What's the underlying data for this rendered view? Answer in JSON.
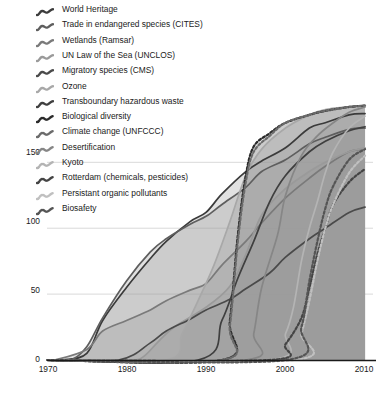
{
  "chart_data": {
    "type": "area",
    "title": "",
    "xlabel": "",
    "ylabel": "",
    "xlim": [
      1970,
      2011
    ],
    "ylim": [
      0,
      195
    ],
    "xticks": [
      "1970",
      "1980",
      "1990",
      "2000",
      "2010"
    ],
    "xtick_values": [
      1970,
      1980,
      1990,
      2000,
      2010
    ],
    "yticks": [
      "0",
      "50",
      "100",
      "150"
    ],
    "ytick_values": [
      0,
      50,
      100,
      150
    ],
    "grid": "horizontal",
    "legend_position": "top-left",
    "stacking": "overlaid-cumulative",
    "series": [
      {
        "name": "World Heritage",
        "label": "World Heritage",
        "color": "#3b3b3b",
        "dash": "solid",
        "x": [
          1970,
          1972,
          1975,
          1977,
          1980,
          1983,
          1985,
          1988,
          1990,
          1992,
          1995,
          1997,
          2000,
          2003,
          2005,
          2008,
          2010
        ],
        "values": [
          0,
          0,
          5,
          30,
          55,
          77,
          90,
          105,
          112,
          126,
          143,
          151,
          161,
          176,
          180,
          186,
          187
        ]
      },
      {
        "name": "Trade in endangered species (CITES)",
        "label": "Trade in endangered species (CITES)",
        "color": "#5e5e5e",
        "dash": "solid",
        "x": [
          1970,
          1973,
          1975,
          1977,
          1980,
          1983,
          1985,
          1988,
          1990,
          1992,
          1995,
          1997,
          2000,
          2003,
          2005,
          2008,
          2010
        ],
        "values": [
          0,
          0,
          10,
          32,
          60,
          82,
          92,
          103,
          109,
          118,
          131,
          143,
          152,
          164,
          169,
          175,
          176
        ]
      },
      {
        "name": "Wetlands (Ramsar)",
        "label": "Wetlands (Ramsar)",
        "color": "#7a7a7a",
        "dash": "solid",
        "x": [
          1970,
          1971,
          1975,
          1977,
          1980,
          1983,
          1985,
          1988,
          1990,
          1992,
          1995,
          1997,
          2000,
          2003,
          2005,
          2008,
          2010
        ],
        "values": [
          0,
          0,
          8,
          22,
          30,
          38,
          45,
          53,
          58,
          72,
          90,
          104,
          123,
          138,
          147,
          158,
          160
        ]
      },
      {
        "name": "UN Law of the Sea (UNCLOS)",
        "label": "UN Law of the Sea (UNCLOS)",
        "color": "#9a9a9a",
        "dash": "solid",
        "x": [
          1970,
          1980,
          1982,
          1984,
          1986,
          1990,
          1993,
          1995,
          1997,
          2000,
          2003,
          2005,
          2008,
          2010
        ],
        "values": [
          0,
          0,
          2,
          14,
          25,
          40,
          56,
          80,
          110,
          130,
          143,
          150,
          158,
          161
        ]
      },
      {
        "name": "Migratory species (CMS)",
        "label": "Migratory species (CMS)",
        "color": "#4a4a4a",
        "dash": "solid",
        "x": [
          1970,
          1979,
          1983,
          1985,
          1988,
          1990,
          1993,
          1995,
          1998,
          2000,
          2003,
          2005,
          2008,
          2010
        ],
        "values": [
          0,
          0,
          13,
          22,
          31,
          38,
          46,
          54,
          66,
          78,
          92,
          100,
          112,
          116
        ]
      },
      {
        "name": "Ozone",
        "label": "Ozone",
        "color": "#a8a8a8",
        "dash": "solid",
        "x": [
          1970,
          1985,
          1987,
          1989,
          1991,
          1993,
          1995,
          1997,
          2000,
          2003,
          2005,
          2008,
          2010
        ],
        "values": [
          0,
          0,
          20,
          45,
          72,
          105,
          140,
          160,
          176,
          186,
          190,
          192,
          193
        ]
      },
      {
        "name": "Transboundary hazardous waste",
        "label": "Transboundary hazardous waste",
        "color": "#3f3f3f",
        "dash": "solid",
        "x": [
          1970,
          1989,
          1992,
          1994,
          1996,
          1998,
          2000,
          2003,
          2005,
          2008,
          2010
        ],
        "values": [
          0,
          0,
          30,
          62,
          90,
          120,
          140,
          158,
          166,
          174,
          177
        ]
      },
      {
        "name": "Biological diversity",
        "label": "Biological diversity",
        "color": "#2b2b2b",
        "dash": "dotted",
        "x": [
          1970,
          1992,
          1993,
          1994,
          1995,
          1996,
          1998,
          2000,
          2003,
          2005,
          2008,
          2010
        ],
        "values": [
          0,
          0,
          30,
          95,
          140,
          162,
          172,
          180,
          186,
          189,
          192,
          193
        ]
      },
      {
        "name": "Climate change (UNFCCC)",
        "label": "Climate change (UNFCCC)",
        "color": "#6b6b6b",
        "dash": "dotted",
        "x": [
          1970,
          1992,
          1993,
          1994,
          1995,
          1996,
          1998,
          2000,
          2003,
          2005,
          2008,
          2010
        ],
        "values": [
          0,
          0,
          26,
          90,
          135,
          158,
          170,
          180,
          186,
          189,
          192,
          193
        ]
      },
      {
        "name": "Desertification",
        "label": "Desertification",
        "color": "#868686",
        "dash": "solid",
        "x": [
          1970,
          1995,
          1996,
          1997,
          1999,
          2000,
          2002,
          2004,
          2006,
          2008,
          2010
        ],
        "values": [
          0,
          0,
          20,
          55,
          95,
          125,
          155,
          170,
          180,
          188,
          192
        ]
      },
      {
        "name": "Kyoto",
        "label": "Kyoto",
        "color": "#b4b4b4",
        "dash": "solid",
        "x": [
          1970,
          1998,
          2000,
          2001,
          2002,
          2003,
          2004,
          2005,
          2006,
          2008,
          2010
        ],
        "values": [
          0,
          0,
          20,
          40,
          75,
          100,
          120,
          142,
          158,
          176,
          185
        ]
      },
      {
        "name": "Rotterdam (chemicals, pesticides)",
        "label": "Rotterdam (chemicals, pesticides)",
        "color": "#444444",
        "dash": "dotted",
        "x": [
          1970,
          1998,
          2000,
          2002,
          2003,
          2004,
          2005,
          2006,
          2008,
          2010
        ],
        "values": [
          0,
          0,
          12,
          32,
          55,
          80,
          100,
          118,
          135,
          145
        ]
      },
      {
        "name": "Persistant organic pollutants",
        "label": "Persistant organic pollutants",
        "color": "#c0c0c0",
        "dash": "dotted",
        "x": [
          1970,
          2001,
          2002,
          2003,
          2004,
          2005,
          2006,
          2008,
          2010
        ],
        "values": [
          0,
          0,
          20,
          45,
          75,
          100,
          118,
          142,
          155
        ]
      },
      {
        "name": "Biosafety",
        "label": "Biosafety",
        "color": "#555555",
        "dash": "dotted",
        "x": [
          1970,
          2000,
          2002,
          2003,
          2004,
          2005,
          2006,
          2008,
          2010
        ],
        "values": [
          0,
          0,
          25,
          60,
          90,
          115,
          132,
          152,
          160
        ]
      }
    ]
  },
  "axes": {
    "y_tick_labels": [
      "150",
      "100",
      "50",
      "0"
    ],
    "x_tick_labels": [
      "1970",
      "1980",
      "1990",
      "2000",
      "2010"
    ]
  },
  "legend": {
    "items": [
      {
        "label": "World Heritage",
        "icon": "squiggle-line-icon",
        "color": "#3b3b3b"
      },
      {
        "label": "Trade in endangered species (CITES)",
        "icon": "squiggle-line-icon",
        "color": "#5e5e5e"
      },
      {
        "label": "Wetlands (Ramsar)",
        "icon": "squiggle-line-icon",
        "color": "#7a7a7a"
      },
      {
        "label": "UN Law of the Sea (UNCLOS)",
        "icon": "squiggle-line-icon",
        "color": "#9a9a9a"
      },
      {
        "label": "Migratory species (CMS)",
        "icon": "squiggle-line-icon",
        "color": "#4a4a4a"
      },
      {
        "label": "Ozone",
        "icon": "squiggle-line-icon",
        "color": "#a8a8a8"
      },
      {
        "label": "Transboundary hazardous waste",
        "icon": "squiggle-line-icon",
        "color": "#3f3f3f"
      },
      {
        "label": "Biological diversity",
        "icon": "squiggle-dotted-icon",
        "color": "#2b2b2b"
      },
      {
        "label": "Climate change (UNFCCC)",
        "icon": "squiggle-dotted-icon",
        "color": "#6b6b6b"
      },
      {
        "label": "Desertification",
        "icon": "squiggle-dotted-icon",
        "color": "#868686"
      },
      {
        "label": "Kyoto",
        "icon": "squiggle-dotted-icon",
        "color": "#b4b4b4"
      },
      {
        "label": "Rotterdam (chemicals, pesticides)",
        "icon": "squiggle-dotted-icon",
        "color": "#444444"
      },
      {
        "label": "Persistant organic pollutants",
        "icon": "squiggle-dotted-icon",
        "color": "#c0c0c0"
      },
      {
        "label": "Biosafety",
        "icon": "squiggle-dotted-icon",
        "color": "#555555"
      }
    ]
  },
  "style": {
    "fill_color": "#9c9c9c",
    "fill_opacity": 0.3,
    "grid_color": "#d9d9d9",
    "axis_color": "#1a1a1a",
    "background": "#ffffff"
  }
}
